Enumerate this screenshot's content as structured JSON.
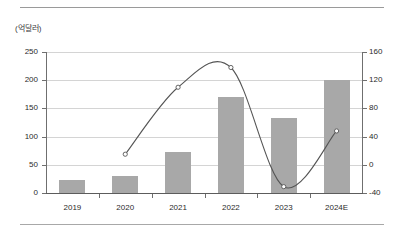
{
  "figure": {
    "unit_label": "(억달러)"
  },
  "chart_data": {
    "type": "bar",
    "title": "",
    "subtitle": "",
    "xlabel": "",
    "ylabel": "(억달러)",
    "categories": [
      "2019",
      "2020",
      "2021",
      "2022",
      "2023",
      "2024E"
    ],
    "grid": true,
    "legend": "none",
    "axes": {
      "left": {
        "label": "(억달러)",
        "ticks": [
          "0",
          "50",
          "100",
          "150",
          "200",
          "250"
        ],
        "tick_values": [
          0,
          50,
          100,
          150,
          200,
          250
        ],
        "ylim": [
          0,
          250
        ]
      },
      "right": {
        "label": "",
        "ticks": [
          "-40",
          "0",
          "40",
          "80",
          "120",
          "160"
        ],
        "tick_values": [
          -40,
          0,
          40,
          80,
          120,
          160
        ],
        "ylim": [
          -40,
          160
        ]
      }
    },
    "series": [
      {
        "name": "시장 규모",
        "type": "bar",
        "axis": "left",
        "color": "#a8a8a8",
        "values": [
          23,
          30,
          72,
          171,
          133,
          201
        ]
      },
      {
        "name": "증가율",
        "type": "line",
        "axis": "right",
        "color": "#555555",
        "marker": "circle-open",
        "values": [
          null,
          15,
          110,
          138,
          -31,
          48
        ]
      }
    ]
  }
}
